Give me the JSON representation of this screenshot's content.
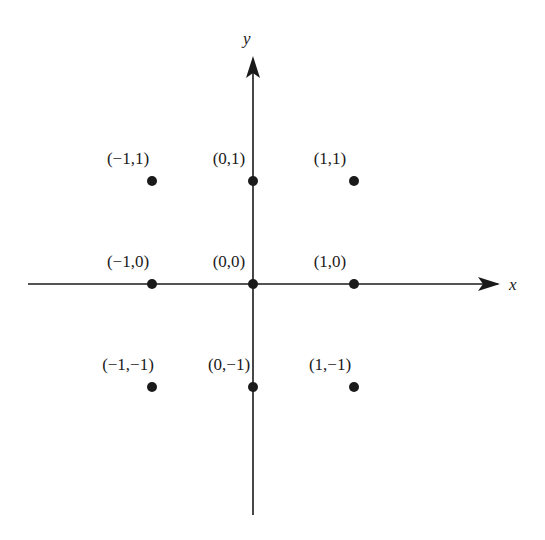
{
  "axes": {
    "x_label": "x",
    "y_label": "y"
  },
  "points": [
    {
      "label": "(−1,1)",
      "x": -1,
      "y": 1
    },
    {
      "label": "(0,1)",
      "x": 0,
      "y": 1
    },
    {
      "label": "(1,1)",
      "x": 1,
      "y": 1
    },
    {
      "label": "(−1,0)",
      "x": -1,
      "y": 0
    },
    {
      "label": "(0,0)",
      "x": 0,
      "y": 0
    },
    {
      "label": "(1,0)",
      "x": 1,
      "y": 0
    },
    {
      "label": "(−1,−1)",
      "x": -1,
      "y": -1
    },
    {
      "label": "(0,−1)",
      "x": 0,
      "y": -1
    },
    {
      "label": "(1,−1)",
      "x": 1,
      "y": -1
    }
  ],
  "colors": {
    "ink": "#1a1a1a",
    "background": "#ffffff"
  }
}
